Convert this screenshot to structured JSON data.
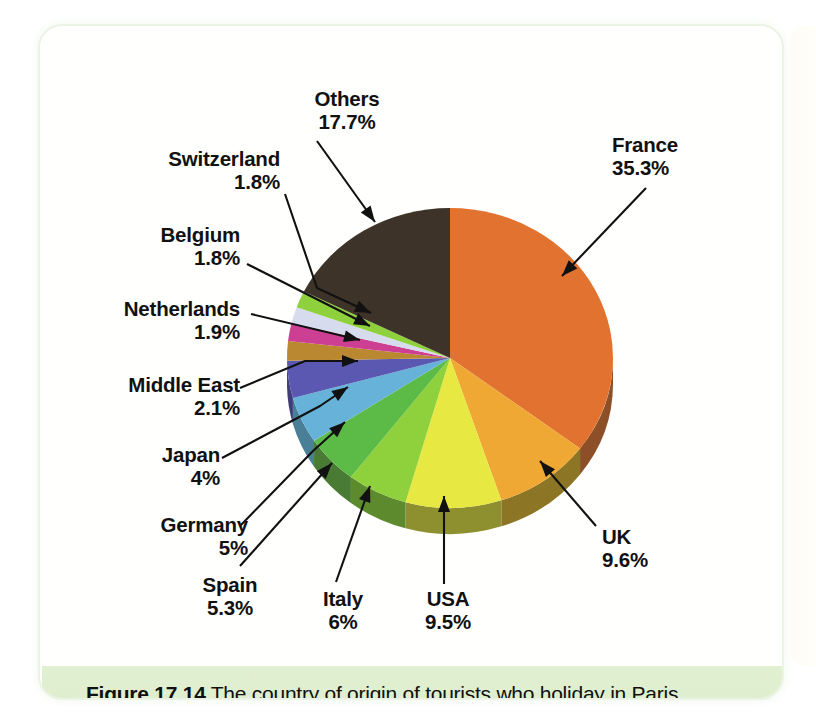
{
  "figure": {
    "caption_number": "Figure 17.14",
    "caption_text": " The country of origin of tourists who holiday in Paris"
  },
  "chart_data": {
    "type": "pie",
    "title": "The country of origin of tourists who holiday in Paris",
    "units": "%",
    "start_angle_deg": 0,
    "direction": "clockwise",
    "three_d": true,
    "legend": "none (direct leader-line labels)",
    "categories": [
      "France",
      "UK",
      "USA",
      "Italy",
      "Spain",
      "Germany",
      "Japan",
      "Middle East",
      "Netherlands",
      "Belgium",
      "Switzerland",
      "Others"
    ],
    "values": [
      35.3,
      9.6,
      9.5,
      6.0,
      5.3,
      5.0,
      4.0,
      2.1,
      1.9,
      1.8,
      1.8,
      17.7
    ],
    "slices": [
      {
        "name": "France",
        "value": 35.3,
        "label": "France",
        "pct_label": "35.3%",
        "color": "#e2722f",
        "side_color": "#8c4f28"
      },
      {
        "name": "UK",
        "value": 9.6,
        "label": "UK",
        "pct_label": "9.6%",
        "color": "#efa833",
        "side_color": "#8c7524"
      },
      {
        "name": "USA",
        "value": 9.5,
        "label": "USA",
        "pct_label": "9.5%",
        "color": "#e8e843",
        "side_color": "#8e9030"
      },
      {
        "name": "Italy",
        "value": 6.0,
        "label": "Italy",
        "pct_label": "6%",
        "color": "#8fd13c",
        "side_color": "#5d8a2c"
      },
      {
        "name": "Spain",
        "value": 5.3,
        "label": "Spain",
        "pct_label": "5.3%",
        "color": "#5cbb46",
        "side_color": "#4a7b34"
      },
      {
        "name": "Germany",
        "value": 5.0,
        "label": "Germany",
        "pct_label": "5%",
        "color": "#66b2d8",
        "side_color": "#4a7f98"
      },
      {
        "name": "Japan",
        "value": 4.0,
        "label": "Japan",
        "pct_label": "4%",
        "color": "#5a58b0",
        "side_color": "#3e3d7a"
      },
      {
        "name": "Middle East",
        "value": 2.1,
        "label": "Middle East",
        "pct_label": "2.1%",
        "color": "#b98830",
        "side_color": "#7d5c22"
      },
      {
        "name": "Netherlands",
        "value": 1.9,
        "label": "Netherlands",
        "pct_label": "1.9%",
        "color": "#cc3f92",
        "side_color": "#8d2c66"
      },
      {
        "name": "Belgium",
        "value": 1.8,
        "label": "Belgium",
        "pct_label": "1.8%",
        "color": "#d6dced",
        "side_color": "#9aa0b0"
      },
      {
        "name": "Switzerland",
        "value": 1.8,
        "label": "Switzerland",
        "pct_label": "1.8%",
        "color": "#8fd13c",
        "side_color": "#5d8a2c"
      },
      {
        "name": "Others",
        "value": 17.7,
        "label": "Others",
        "pct_label": "17.7%",
        "color": "#3d3328",
        "side_color": "#2a231b"
      }
    ]
  },
  "labels": {
    "others": {
      "name": "Others",
      "pct": "17.7%"
    },
    "switzerland": {
      "name": "Switzerland",
      "pct": "1.8%"
    },
    "belgium": {
      "name": "Belgium",
      "pct": "1.8%"
    },
    "netherlands": {
      "name": "Netherlands",
      "pct": "1.9%"
    },
    "middle_east": {
      "name": "Middle East",
      "pct": "2.1%"
    },
    "japan": {
      "name": "Japan",
      "pct": "4%"
    },
    "germany": {
      "name": "Germany",
      "pct": "5%"
    },
    "spain": {
      "name": "Spain",
      "pct": "5.3%"
    },
    "italy": {
      "name": "Italy",
      "pct": "6%"
    },
    "usa": {
      "name": "USA",
      "pct": "9.5%"
    },
    "uk": {
      "name": "UK",
      "pct": "9.6%"
    },
    "france": {
      "name": "France",
      "pct": "35.3%"
    }
  }
}
